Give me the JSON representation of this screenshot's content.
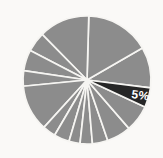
{
  "chart_data": {
    "type": "pie",
    "title": "",
    "start_angle_deg": -7,
    "direction": "ccw",
    "background": "#faf9f7",
    "border_color": "#f6f5f2",
    "slice_gray": "#8c8c8c",
    "slice_black": "#262626",
    "label_text_color": "#ffffff",
    "legend": "none",
    "segments": [
      {
        "value": 10.3,
        "color": "#8c8c8c",
        "label": ""
      },
      {
        "value": 16.2,
        "color": "#8c8c8c",
        "label": ""
      },
      {
        "value": 12.8,
        "color": "#8c8c8c",
        "label": ""
      },
      {
        "value": 5.0,
        "color": "#8c8c8c",
        "label": ""
      },
      {
        "value": 5.3,
        "color": "#8c8c8c",
        "label": ""
      },
      {
        "value": 3.9,
        "color": "#8c8c8c",
        "label": ""
      },
      {
        "value": 11.7,
        "color": "#8c8c8c",
        "label": ""
      },
      {
        "value": 3.3,
        "color": "#8c8c8c",
        "label": ""
      },
      {
        "value": 3.9,
        "color": "#8c8c8c",
        "label": ""
      },
      {
        "value": 2.8,
        "color": "#8c8c8c",
        "label": ""
      },
      {
        "value": 3.1,
        "color": "#8c8c8c",
        "label": ""
      },
      {
        "value": 3.9,
        "color": "#8c8c8c",
        "label": ""
      },
      {
        "value": 6.1,
        "color": "#8c8c8c",
        "label": ""
      },
      {
        "value": 6.7,
        "color": "#8c8c8c",
        "label": ""
      },
      {
        "value": 5.0,
        "color": "#262626",
        "label": "5%",
        "label_color": "#ffffff"
      }
    ]
  }
}
